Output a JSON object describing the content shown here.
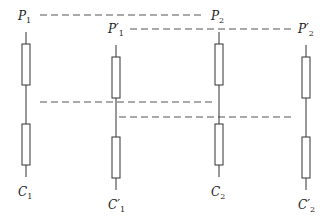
{
  "diagram": {
    "type": "column-resistor-alignment",
    "columns": [
      {
        "id": "col1",
        "top_label": "P",
        "top_prime": "",
        "top_sub": "1",
        "bottom_label": "C",
        "bottom_prime": "",
        "bottom_sub": "1",
        "x": 26,
        "offset": 0
      },
      {
        "id": "col2",
        "top_label": "P",
        "top_prime": "′",
        "top_sub": "1",
        "bottom_label": "C",
        "bottom_prime": "′",
        "bottom_sub": "1",
        "x": 116,
        "offset": 13
      },
      {
        "id": "col3",
        "top_label": "P",
        "top_prime": "",
        "top_sub": "2",
        "bottom_label": "C",
        "bottom_prime": "",
        "bottom_sub": "2",
        "x": 219,
        "offset": 0
      },
      {
        "id": "col4",
        "top_label": "P",
        "top_prime": "′",
        "top_sub": "2",
        "bottom_label": "C",
        "bottom_prime": "′",
        "bottom_sub": "2",
        "x": 306,
        "offset": 13
      }
    ],
    "dashed_lines": [
      {
        "from": "P1",
        "to": "P2",
        "y": 15,
        "x1": 40,
        "x2": 205
      },
      {
        "from": "P1'",
        "to": "P2'",
        "y": 29,
        "x1": 130,
        "x2": 292
      },
      {
        "from": "col1-mid",
        "to": "col3-mid",
        "y": 102,
        "x1": 40,
        "x2": 216
      },
      {
        "from": "col2-mid",
        "to": "col4-mid",
        "y": 117,
        "x1": 119,
        "x2": 295
      }
    ],
    "colors": {
      "stroke": "#333333",
      "dash": "#555555",
      "background": "#ffffff"
    }
  }
}
